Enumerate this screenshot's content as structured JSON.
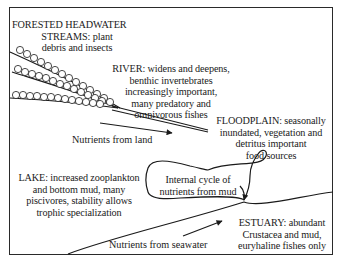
{
  "diagram": {
    "zones": [
      {
        "id": "headwater",
        "lines": [
          "FORESTED HEADWATER",
          "STREAMS: plant",
          "debris and insects"
        ]
      },
      {
        "id": "river",
        "lines": [
          "RIVER: widens and deepens,",
          "benthic invertebrates",
          "increasingly important,",
          "many predatory and",
          "omnivorous fishes"
        ]
      },
      {
        "id": "floodplain",
        "lines": [
          "FLOODPLAIN: seasonally",
          "inundated, vegetation and",
          "detritus important",
          "food sources"
        ]
      },
      {
        "id": "lake",
        "lines": [
          "LAKE: increased zooplankton",
          "and bottom mud, many",
          "piscivores, stability allows",
          "trophic specialization"
        ]
      },
      {
        "id": "internal-cycle",
        "lines": [
          "Internal cycle of",
          "nutrients from mud"
        ]
      },
      {
        "id": "estuary",
        "lines": [
          "ESTUARY: abundant",
          "Crustacea and mud,",
          "euryhaline fishes only"
        ]
      }
    ],
    "arrows": [
      {
        "id": "nutrients-land",
        "label": "Nutrients from land"
      },
      {
        "id": "nutrients-seawater",
        "label": "Nutrients from seawater"
      }
    ],
    "colors": {
      "line": "#1a1a1a",
      "background": "#ffffff"
    }
  }
}
